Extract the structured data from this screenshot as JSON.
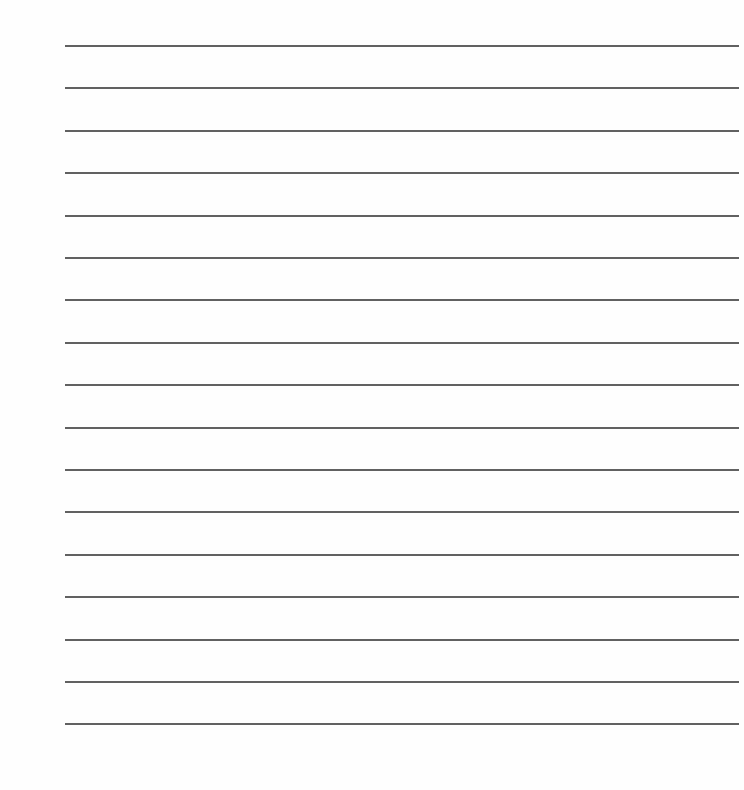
{
  "document": {
    "type": "lined-paper",
    "background_color": "#fefefe",
    "rule_color": "#505050",
    "rule_count": 17,
    "rule_left_px": 65,
    "rule_right_px": 739,
    "first_rule_top_px": 45,
    "rule_spacing_px": 42.4,
    "rules": [
      {
        "index": 1
      },
      {
        "index": 2
      },
      {
        "index": 3
      },
      {
        "index": 4
      },
      {
        "index": 5
      },
      {
        "index": 6
      },
      {
        "index": 7
      },
      {
        "index": 8
      },
      {
        "index": 9
      },
      {
        "index": 10
      },
      {
        "index": 11
      },
      {
        "index": 12
      },
      {
        "index": 13
      },
      {
        "index": 14
      },
      {
        "index": 15
      },
      {
        "index": 16
      },
      {
        "index": 17
      }
    ]
  }
}
